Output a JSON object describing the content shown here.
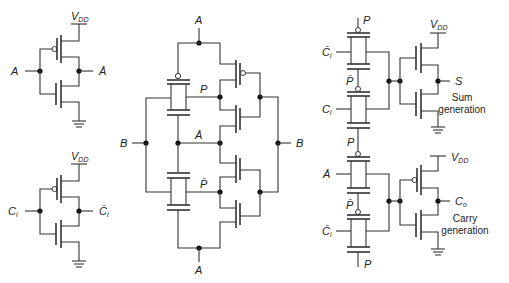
{
  "diagram": {
    "type": "CMOS transmission-gate full adder schematic",
    "inverter_a": {
      "input": "A",
      "output": "Ā",
      "supply": "V",
      "supply_sub": "DD"
    },
    "inverter_ci": {
      "input": "C",
      "input_sub": "i",
      "output": "C̄",
      "output_sub": "i",
      "supply": "V",
      "supply_sub": "DD"
    },
    "xor_block": {
      "top_input": "A",
      "bottom_input": "A",
      "left_input": "B",
      "right_input": "B",
      "mid_label": "Ā",
      "upper_output": "P",
      "lower_output": "P̄"
    },
    "sum_block": {
      "tg1_control": "P",
      "tg1_input": "C̄",
      "tg1_input_sub": "i",
      "tg2_control": "P̄",
      "tg2_input": "C",
      "tg2_input_sub": "i",
      "tg2_bottom_control": "P",
      "supply": "V",
      "supply_sub": "DD",
      "output": "S",
      "caption_line1": "Sum",
      "caption_line2": "generation"
    },
    "carry_block": {
      "tg1_input": "Ā",
      "tg2_control": "P̄",
      "tg2_input": "C̄",
      "tg2_input_sub": "i",
      "bottom_control": "P",
      "supply": "V",
      "supply_sub": "DD",
      "output": "C",
      "output_sub": "o",
      "caption_line1": "Carry",
      "caption_line2": "generation"
    }
  }
}
